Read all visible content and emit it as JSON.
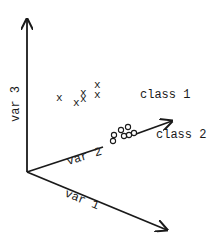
{
  "diagram": {
    "type": "3d-feature-space-scatter",
    "colors": {
      "ink": "#1a1a1a",
      "background": "#ffffff"
    },
    "axes": [
      {
        "id": "var1",
        "label": "var 1"
      },
      {
        "id": "var2",
        "label": "var 2"
      },
      {
        "id": "var3",
        "label": "var 3"
      }
    ],
    "classes": [
      {
        "id": "class1",
        "label": "class 1",
        "marker": "x",
        "count": 6
      },
      {
        "id": "class2",
        "label": "class 2",
        "marker": "o",
        "count": 7
      }
    ]
  }
}
